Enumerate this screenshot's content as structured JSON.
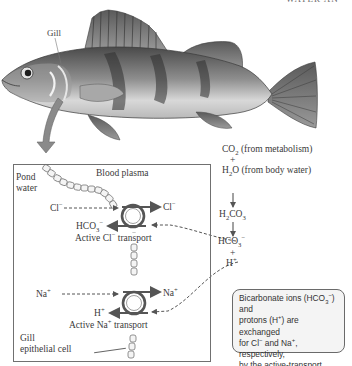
{
  "header": {
    "cut_title": "WATER AN"
  },
  "fish": {
    "gill_label": "Gill"
  },
  "panel": {
    "pond_water_label": [
      "Pond",
      "water"
    ],
    "blood_plasma_label": "Blood plasma",
    "epithelial_label": [
      "Gill",
      "epithelial cell"
    ],
    "chloride_transport": {
      "in_ion": "Cl",
      "in_ion_charge": "−",
      "out_ion": "Cl",
      "out_ion_charge": "−",
      "exchange_ion": "HCO",
      "exchange_ion_sub": "3",
      "exchange_ion_charge": "−",
      "label_pre": "Active Cl",
      "label_charge": "−",
      "label_post": " transport"
    },
    "sodium_transport": {
      "in_ion": "Na",
      "in_ion_charge": "+",
      "out_ion": "Na",
      "out_ion_charge": "+",
      "exchange_ion": "H",
      "exchange_ion_charge": "+",
      "label_pre": "Active Na",
      "label_charge": "+",
      "label_post": " transport"
    }
  },
  "reaction": {
    "co2": {
      "formula": "CO",
      "sub": "2",
      "note": " (from metabolism)"
    },
    "plus1": "+",
    "h2o": {
      "pre": "H",
      "sub": "2",
      "post": "O",
      "note": " (from body water)"
    },
    "h2co3": {
      "pre": "H",
      "sub1": "2",
      "mid": "CO",
      "sub2": "3"
    },
    "hco3": {
      "pre": "HCO",
      "sub": "3",
      "charge": "−"
    },
    "plus2": "+",
    "h": {
      "pre": "H",
      "charge": "+"
    }
  },
  "note": {
    "lines": [
      "Bicarbonate ions (HCO",
      "3",
      "−",
      ") and",
      "protons (H",
      "+",
      ") are exchanged",
      "for Cl",
      "−",
      " and  Na",
      "+",
      ", respectively,",
      "by the active-transport mech-",
      "anisms, which require ATP."
    ]
  },
  "colors": {
    "arrow_fill": "#8a8a8a",
    "pump_ring": "#555555",
    "panel_border": "#707070"
  }
}
